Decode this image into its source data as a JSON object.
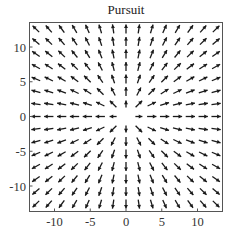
{
  "chart_data": {
    "type": "quiver",
    "title": "Pursuit",
    "xlabel": "",
    "ylabel": "",
    "xlim": [
      -13.5,
      13.5
    ],
    "ylim": [
      -13.5,
      13.5
    ],
    "grid": false,
    "x_ticks": [
      -10,
      -5,
      0,
      5,
      10
    ],
    "y_ticks": [
      -10,
      -5,
      0,
      5,
      10
    ],
    "x_tick_labels": [
      "-10",
      "-5",
      "0",
      "5",
      "10"
    ],
    "y_tick_labels": [
      "-10",
      "-5",
      "0",
      "5",
      "10"
    ],
    "field": {
      "description": "Radially outward unit-direction vector field (v = (x, y)/|(x,y)|), no arrow at origin",
      "grid_x": [
        -12.6,
        -10.8,
        -9.0,
        -7.2,
        -5.4,
        -3.6,
        -1.8,
        0,
        1.8,
        3.6,
        5.4,
        7.2,
        9.0,
        10.8,
        12.6
      ],
      "grid_y": [
        -12.6,
        -10.8,
        -9.0,
        -7.2,
        -5.4,
        -3.6,
        -1.8,
        0,
        1.8,
        3.6,
        5.4,
        7.2,
        9.0,
        10.8,
        12.6
      ],
      "arrow_length_units": 1.3,
      "omit_origin": true
    },
    "colors": {
      "arrow": "#1a1a1a",
      "frame": "#555555",
      "background": "#ffffff"
    }
  }
}
